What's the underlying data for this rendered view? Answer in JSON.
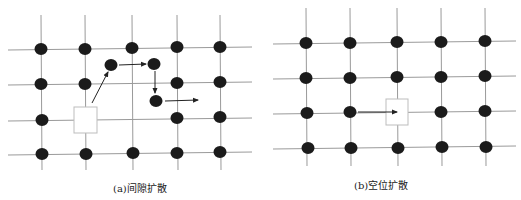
{
  "colors": {
    "line": "#9a9a9a",
    "atom": "#1b1b1b",
    "arrow": "#222222",
    "vacancy_border": "#bdbdbd",
    "background": "#ffffff"
  },
  "panels": [
    {
      "id": "a",
      "caption": "(a)间隙扩散",
      "grid": {
        "cols_x": [
          41,
          85,
          132,
          177,
          220
        ],
        "rows_y": [
          49,
          84,
          120,
          154
        ],
        "h_line_x": [
          8,
          252
        ],
        "v_line_y": [
          15,
          170
        ]
      },
      "lattice_atoms": [
        [
          41,
          49
        ],
        [
          85,
          49
        ],
        [
          132,
          48
        ],
        [
          177,
          47
        ],
        [
          220,
          47
        ],
        [
          41,
          84
        ],
        [
          85,
          84
        ],
        [
          177,
          83
        ],
        [
          220,
          82
        ],
        [
          42,
          120
        ],
        [
          177,
          118
        ],
        [
          220,
          117
        ],
        [
          42,
          154
        ],
        [
          86,
          154
        ],
        [
          133,
          153
        ],
        [
          177,
          153
        ],
        [
          220,
          152
        ]
      ],
      "vacancy": {
        "x": 74,
        "y": 107,
        "w": 23,
        "h": 26
      },
      "interstitial_atoms": [
        [
          111,
          65
        ],
        [
          154,
          64
        ],
        [
          156,
          101
        ]
      ],
      "arrows": [
        {
          "from": [
            92,
            103
          ],
          "to": [
            108,
            72
          ]
        },
        {
          "from": [
            119,
            65
          ],
          "to": [
            146,
            64
          ]
        },
        {
          "from": [
            155,
            71
          ],
          "to": [
            155,
            93
          ]
        },
        {
          "from": [
            165,
            101
          ],
          "to": [
            198,
            100
          ]
        }
      ]
    },
    {
      "id": "b",
      "caption": "(b)空位扩散",
      "grid": {
        "cols_x": [
          306,
          350,
          397,
          441,
          485
        ],
        "rows_y": [
          43,
          78,
          113,
          148
        ],
        "h_line_x": [
          273,
          516
        ],
        "v_line_y": [
          8,
          166
        ]
      },
      "lattice_atoms": [
        [
          306,
          43
        ],
        [
          350,
          43
        ],
        [
          397,
          42
        ],
        [
          441,
          42
        ],
        [
          485,
          41
        ],
        [
          306,
          78
        ],
        [
          350,
          78
        ],
        [
          397,
          77
        ],
        [
          441,
          77
        ],
        [
          485,
          76
        ],
        [
          307,
          113
        ],
        [
          350,
          112
        ],
        [
          441,
          112
        ],
        [
          485,
          111
        ],
        [
          308,
          148
        ],
        [
          351,
          148
        ],
        [
          398,
          148
        ],
        [
          442,
          147
        ],
        [
          486,
          147
        ]
      ],
      "vacancy": {
        "x": 386,
        "y": 99,
        "w": 22,
        "h": 26
      },
      "interstitial_atoms": [],
      "arrows": [
        {
          "from": [
            358,
            112
          ],
          "to": [
            397,
            112
          ]
        }
      ]
    }
  ]
}
